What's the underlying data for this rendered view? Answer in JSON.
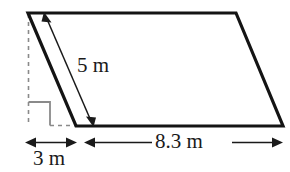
{
  "figure": {
    "kind": "parallelogram-with-height-and-base-dimensions",
    "colors": {
      "outline": "#141414",
      "dashed_guide": "#8a8a8a",
      "right_angle_marker": "#8a8a8a",
      "dimension_arrow": "#1a1a1a",
      "text": "#1a1a1a",
      "background": "#ffffff"
    },
    "shape": {
      "name": "parallelogram",
      "vertices": [
        {
          "name": "top-left",
          "x": 28,
          "y": 13
        },
        {
          "name": "top-right",
          "x": 236,
          "y": 13
        },
        {
          "name": "bottom-right",
          "x": 283,
          "y": 126
        },
        {
          "name": "bottom-left",
          "x": 76,
          "y": 126
        }
      ]
    },
    "measurements": [
      {
        "id": "height",
        "label": "5 m",
        "value": 5,
        "unit": "m",
        "arrow": "double-headed",
        "describes": "slant side length"
      },
      {
        "id": "base",
        "label": "8.3 m",
        "value": 8.3,
        "unit": "m",
        "arrow": "double-headed",
        "describes": "bottom base length"
      },
      {
        "id": "offset",
        "label": "3 m",
        "value": 3,
        "unit": "m",
        "arrow": "double-headed",
        "describes": "horizontal offset from dashed vertical to bottom-left vertex"
      }
    ],
    "markers": [
      {
        "id": "right-angle",
        "symbol": "square",
        "describes": "right angle between dashed vertical guide and dashed horizontal guide"
      },
      {
        "id": "dashed-vertical-guide",
        "describes": "vertical dashed line dropped from top-left vertex"
      },
      {
        "id": "dashed-horizontal-guide",
        "describes": "short dashed segment along the baseline left of the bottom-left vertex"
      }
    ]
  }
}
